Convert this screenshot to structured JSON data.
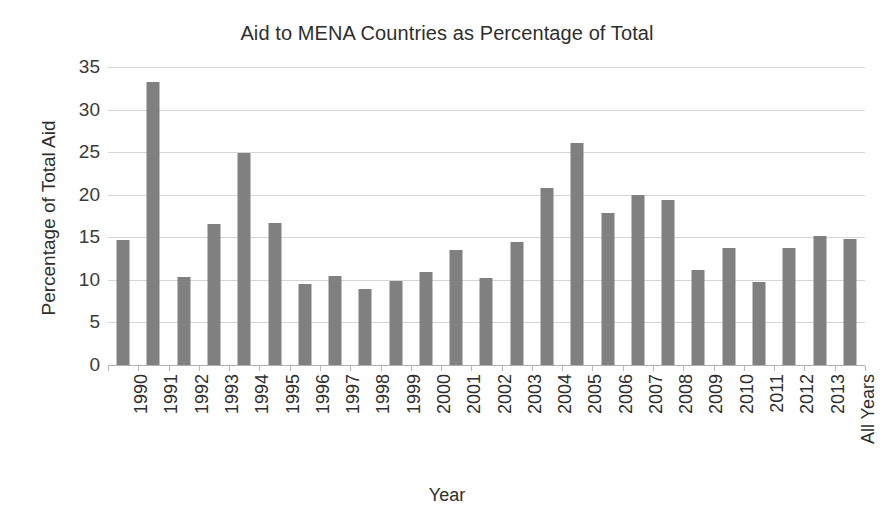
{
  "chart_data": {
    "type": "bar",
    "title": "Aid to MENA Countries as Percentage of Total",
    "xlabel": "Year",
    "ylabel": "Percentage of Total Aid",
    "ylim": [
      0,
      35
    ],
    "ytick_step": 5,
    "yticks": [
      0,
      5,
      10,
      15,
      20,
      25,
      30,
      35
    ],
    "ytick_labels": [
      "0",
      "5",
      "10",
      "15",
      "20",
      "25",
      "30",
      "35"
    ],
    "grid": "horizontal",
    "legend": "none",
    "bar_color": "#808080",
    "gridline_color": "#d6d6d6",
    "categories": [
      "1990",
      "1991",
      "1992",
      "1993",
      "1994",
      "1995",
      "1996",
      "1997",
      "1998",
      "1999",
      "2000",
      "2001",
      "2002",
      "2003",
      "2004",
      "2005",
      "2006",
      "2007",
      "2008",
      "2009",
      "2010",
      "2011",
      "2012",
      "2013",
      "All Years"
    ],
    "values": [
      14.7,
      33.2,
      10.3,
      16.6,
      24.9,
      16.7,
      9.5,
      10.5,
      8.9,
      9.9,
      10.9,
      13.5,
      10.2,
      14.5,
      20.8,
      26.1,
      17.8,
      20.0,
      19.4,
      11.2,
      13.8,
      9.7,
      13.7,
      15.2,
      14.8
    ]
  }
}
